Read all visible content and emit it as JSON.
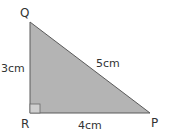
{
  "diagram": {
    "type": "right-triangle",
    "vertices": {
      "Q": {
        "label": "Q"
      },
      "R": {
        "label": "R"
      },
      "P": {
        "label": "P"
      }
    },
    "sides": {
      "QR": {
        "label": "3cm"
      },
      "QP": {
        "label": "5cm"
      },
      "RP": {
        "label": "4cm"
      }
    },
    "right_angle_at": "R",
    "colors": {
      "fill": "#b4b4b4",
      "stroke": "#5a5a5a",
      "text": "#333333"
    }
  }
}
